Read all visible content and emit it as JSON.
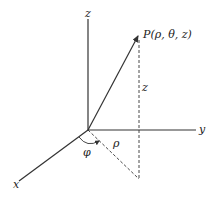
{
  "diagram": {
    "labels": {
      "z_axis": "z",
      "y_axis": "y",
      "x_axis": "x",
      "point": "P(ρ, θ, z)",
      "height": "z",
      "radius": "ρ",
      "angle": "φ"
    },
    "colors": {
      "line": "#333333",
      "background": "#ffffff"
    }
  }
}
